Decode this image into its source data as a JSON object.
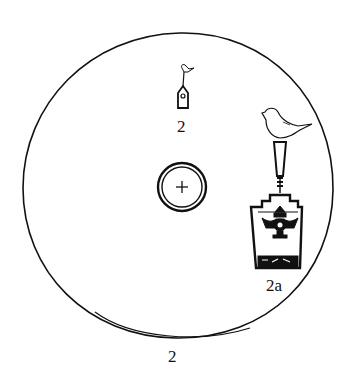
{
  "figure": {
    "labels": {
      "small_ornament": "2",
      "large_ornament": "2a",
      "caption": "2"
    },
    "elements": [
      {
        "name": "disc-outline",
        "shape": "circle"
      },
      {
        "name": "center-ring",
        "shape": "double circle with plus mark"
      },
      {
        "name": "small-ornament",
        "shape": "bird atop small pendant"
      },
      {
        "name": "large-ornament",
        "shape": "bird atop stepped pendant with decoration"
      }
    ],
    "colors": {
      "ink": "#111111",
      "background": "#ffffff"
    }
  }
}
